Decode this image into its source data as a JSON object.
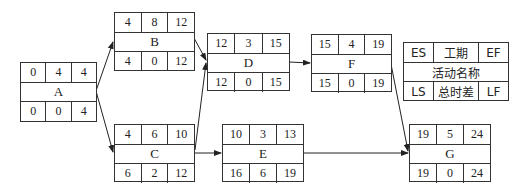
{
  "diagram": {
    "type": "activity-on-node network",
    "nodes": [
      {
        "id": "A",
        "es": "0",
        "dur": "4",
        "ef": "4",
        "ls": "0",
        "tf": "0",
        "lf": "4"
      },
      {
        "id": "B",
        "es": "4",
        "dur": "8",
        "ef": "12",
        "ls": "4",
        "tf": "0",
        "lf": "12"
      },
      {
        "id": "C",
        "es": "4",
        "dur": "6",
        "ef": "10",
        "ls": "6",
        "tf": "2",
        "lf": "12"
      },
      {
        "id": "D",
        "es": "12",
        "dur": "3",
        "ef": "15",
        "ls": "12",
        "tf": "0",
        "lf": "15"
      },
      {
        "id": "E",
        "es": "10",
        "dur": "3",
        "ef": "13",
        "ls": "16",
        "tf": "6",
        "lf": "19"
      },
      {
        "id": "F",
        "es": "15",
        "dur": "4",
        "ef": "19",
        "ls": "15",
        "tf": "0",
        "lf": "19"
      },
      {
        "id": "G",
        "es": "19",
        "dur": "5",
        "ef": "24",
        "ls": "19",
        "tf": "0",
        "lf": "24"
      }
    ],
    "edges": [
      {
        "from": "A",
        "to": "B"
      },
      {
        "from": "A",
        "to": "C"
      },
      {
        "from": "B",
        "to": "D"
      },
      {
        "from": "C",
        "to": "D"
      },
      {
        "from": "C",
        "to": "E"
      },
      {
        "from": "D",
        "to": "F"
      },
      {
        "from": "F",
        "to": "G"
      },
      {
        "from": "E",
        "to": "G"
      }
    ],
    "legend": {
      "es": "ES",
      "duration": "工期",
      "ef": "EF",
      "name": "活动名称",
      "ls": "LS",
      "total_float": "总时差",
      "lf": "LF"
    }
  }
}
